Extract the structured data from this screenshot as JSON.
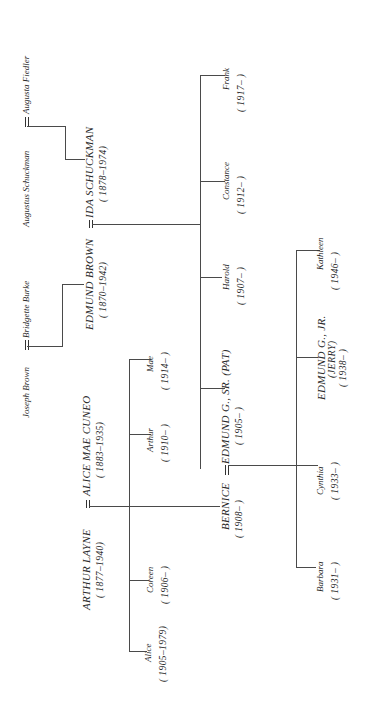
{
  "tree": {
    "orientation": "rotated-90-ccw",
    "generation_1": {
      "brown_parents": {
        "father": "Joseph Brown",
        "mother": "Bridgette Burke"
      },
      "schuckman_parents": {
        "father": "Augustus Schuckman",
        "mother": "Augusta Fiedler"
      }
    },
    "generation_2": {
      "edmund_brown": {
        "name": "EDMUND BROWN",
        "years": "( 1870–1942)"
      },
      "ida_schuckman": {
        "name": "IDA SCHUCKMAN",
        "years": "( 1878–1974)"
      },
      "arthur_layne": {
        "name": "ARTHUR LAYNE",
        "years": "( 1877–1940)"
      },
      "alice_mae_cuneo": {
        "name": "ALICE MAE CUNEO",
        "years": "( 1883–1935)"
      }
    },
    "layne_children": [
      {
        "name": "Alice",
        "years": "( 1905–1979)"
      },
      {
        "name": "Coreen",
        "years": "( 1906–        )"
      },
      {
        "name": "Arthur",
        "years": "( 1910–    )"
      },
      {
        "name": "Mae",
        "years": "( 1914–    )"
      }
    ],
    "brown_children": [
      {
        "name": "EDMUND G., SR. (PAT)",
        "years": "( 1905–        )"
      },
      {
        "name": "Harold",
        "years": "( 1907–    )"
      },
      {
        "name": "Constance",
        "years": "( 1912–    )"
      },
      {
        "name": "Frank",
        "years": "( 1917–        )"
      }
    ],
    "bernice": {
      "name": "BERNICE",
      "years": "( 1908–    )"
    },
    "generation_4": [
      {
        "name": "Barbara",
        "years": "( 1931–        )"
      },
      {
        "name": "Cynthia",
        "years": "( 1933–        )"
      },
      {
        "name": "EDMUND G., JR.",
        "nickname": "(JERRY)",
        "years": "( 1938–        )"
      },
      {
        "name": "Kathleen",
        "years": "( 1946–        )"
      }
    ]
  }
}
